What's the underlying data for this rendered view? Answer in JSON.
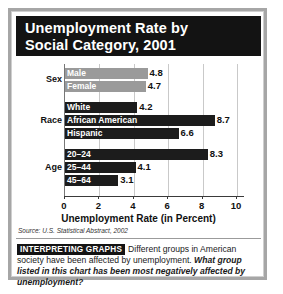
{
  "title": {
    "line1": "Unemployment Rate by",
    "line2": "Social Category, 2001"
  },
  "source": "Source: U.S. Statistical Abstract, 2002",
  "caption": {
    "tag": "INTERPRETING GRAPHS",
    "body": "Different groups in American society have been affected by unemployment.",
    "question": "What group listed in this chart has been most negatively affected by unemployment?"
  },
  "chart_data": {
    "type": "bar",
    "orientation": "horizontal",
    "title": "Unemployment Rate by Social Category, 2001",
    "xlabel": "Unemployment Rate (in Percent)",
    "ylabel": "",
    "xlim": [
      0,
      10
    ],
    "xticks": [
      "0",
      "2",
      "4",
      "6",
      "8",
      "10"
    ],
    "xtick_values": [
      0,
      2,
      4,
      6,
      8,
      10
    ],
    "grid": true,
    "legend": "none",
    "colors": {
      "sex_bars": "#9a9a9a",
      "race_bars": "#1c1c1c",
      "age_bars": "#1c1c1c",
      "banner": "#131313",
      "frame": "#a6a6a6"
    },
    "groups": [
      {
        "group": "Sex",
        "shade": "light",
        "bars": [
          {
            "label": "Male",
            "value": 4.8,
            "value_text": "4.8"
          },
          {
            "label": "Female",
            "value": 4.7,
            "value_text": "4.7"
          }
        ]
      },
      {
        "group": "Race",
        "shade": "dark",
        "bars": [
          {
            "label": "White",
            "value": 4.2,
            "value_text": "4.2"
          },
          {
            "label": "African American",
            "value": 8.7,
            "value_text": "8.7"
          },
          {
            "label": "Hispanic",
            "value": 6.6,
            "value_text": "6.6"
          }
        ]
      },
      {
        "group": "Age",
        "shade": "dark",
        "bars": [
          {
            "label": "20–24",
            "value": 8.3,
            "value_text": "8.3"
          },
          {
            "label": "25–44",
            "value": 4.1,
            "value_text": "4.1"
          },
          {
            "label": "45–64",
            "value": 3.1,
            "value_text": "3.1"
          }
        ]
      }
    ],
    "categories": [
      "Male",
      "Female",
      "White",
      "African American",
      "Hispanic",
      "20-24",
      "25-44",
      "45-64"
    ],
    "values": [
      4.8,
      4.7,
      4.2,
      8.7,
      6.6,
      8.3,
      4.1,
      3.1
    ]
  }
}
